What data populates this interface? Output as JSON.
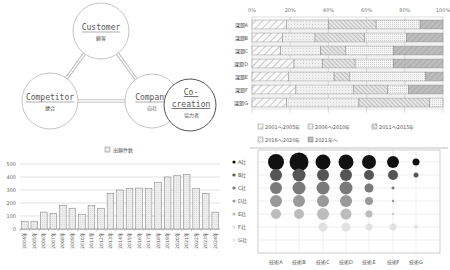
{
  "diagram": {
    "nodes": [
      {
        "id": "customer",
        "en": "Customer",
        "ja": "顧客",
        "cx": 101,
        "cy": 31,
        "r": 28
      },
      {
        "id": "competitor",
        "en": "Competitor",
        "ja": "競合",
        "cx": 50,
        "cy": 101,
        "r": 28
      },
      {
        "id": "company",
        "en": "Company",
        "ja": "自社",
        "cx": 152,
        "cy": 101,
        "r": 27
      },
      {
        "id": "cocreation",
        "en1": "Co-",
        "en2": "creation",
        "ja": "協力者",
        "cx": 190,
        "cy": 105,
        "r": 26
      }
    ]
  },
  "chart_data": [
    {
      "type": "bar",
      "orientation": "horizontal",
      "stacked": "percent",
      "title": "",
      "categories": [
        "課題A",
        "課題B",
        "課題C",
        "課題D",
        "課題E",
        "課題F",
        "課題G"
      ],
      "xticks": [
        "0%",
        "20%",
        "40%",
        "60%",
        "80%",
        "100%"
      ],
      "xlim": [
        0,
        100
      ],
      "legend_position": "bottom",
      "series": [
        {
          "name": "2001～2005年",
          "values": [
            18,
            16,
            15,
            22,
            19,
            23,
            18
          ]
        },
        {
          "name": "2006～2010年",
          "values": [
            22,
            17,
            21,
            15,
            24,
            30,
            38
          ]
        },
        {
          "name": "2011～2015年",
          "values": [
            25,
            26,
            13,
            17,
            8,
            18,
            37
          ]
        },
        {
          "name": "2016～2020年",
          "values": [
            23,
            22,
            25,
            20,
            40,
            11,
            7
          ]
        },
        {
          "name": "2021年～",
          "values": [
            12,
            19,
            26,
            26,
            9,
            18,
            0
          ]
        }
      ]
    },
    {
      "type": "bar",
      "title": "",
      "legend": [
        "出願件数"
      ],
      "legend_position": "top",
      "categories": [
        "2004年",
        "2005年",
        "2006年",
        "2007年",
        "2008年",
        "2009年",
        "2010年",
        "2011年",
        "2012年",
        "2013年",
        "2014年",
        "2015年",
        "2016年",
        "2017年",
        "2018年",
        "2019年",
        "2020年",
        "2021年",
        "2022年",
        "2023年",
        "2024年"
      ],
      "values": [
        60,
        60,
        130,
        120,
        180,
        160,
        110,
        180,
        160,
        275,
        300,
        310,
        315,
        310,
        360,
        400,
        410,
        420,
        310,
        275,
        130
      ],
      "yticks": [
        "0",
        "100",
        "200",
        "300",
        "400",
        "500"
      ],
      "ylim": [
        0,
        500
      ],
      "grid": true,
      "xlabel": "",
      "ylabel": ""
    },
    {
      "type": "scatter",
      "subtype": "bubble",
      "title": "",
      "x_categories": [
        "技術A",
        "技術B",
        "技術C",
        "技術D",
        "技術E",
        "技術F",
        "技術G"
      ],
      "y_categories": [
        "A社",
        "B社",
        "C社",
        "D社",
        "E社",
        "F社",
        "G社"
      ],
      "series_colors": [
        "#111111",
        "#555555",
        "#7a7a7a",
        "#999999",
        "#bcbcbc",
        "#e2e2e2",
        "#f2f2f2"
      ],
      "sizes": [
        [
          8,
          9.5,
          7.5,
          7.5,
          7,
          6,
          3.5
        ],
        [
          6,
          6.5,
          6,
          6,
          5,
          5,
          2.5
        ],
        [
          6,
          6.5,
          6.5,
          6.5,
          4.5,
          1.5,
          0
        ],
        [
          6,
          6,
          6,
          6,
          4,
          1.2,
          0
        ],
        [
          5,
          5,
          6,
          5.5,
          3.5,
          1,
          0
        ],
        [
          0,
          0,
          4.5,
          4.5,
          3.5,
          3.5,
          2
        ],
        [
          0,
          0,
          0,
          0,
          0,
          0,
          0
        ]
      ],
      "legend_position": "left",
      "grid": true
    }
  ]
}
